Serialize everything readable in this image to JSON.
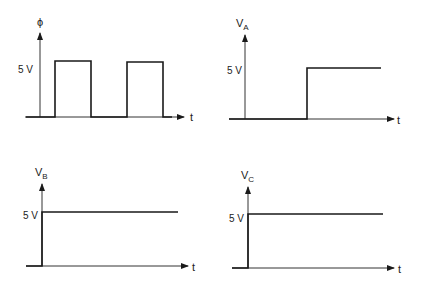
{
  "figure": {
    "panels": [
      {
        "id": "phi",
        "y_label": "ϕ",
        "y_subscript": "",
        "level_label": "5 V",
        "x_label": "t",
        "signal": "square-wave",
        "pulses": 2
      },
      {
        "id": "VA",
        "y_label": "V",
        "y_subscript": "A",
        "level_label": "5 V",
        "x_label": "t",
        "signal": "delayed-step"
      },
      {
        "id": "VB",
        "y_label": "V",
        "y_subscript": "B",
        "level_label": "5 V",
        "x_label": "t",
        "signal": "immediate-step"
      },
      {
        "id": "VC",
        "y_label": "V",
        "y_subscript": "C",
        "level_label": "5 V",
        "x_label": "t",
        "signal": "immediate-step"
      }
    ]
  },
  "colors": {
    "line": "#1a1a1a",
    "background": "#ffffff"
  }
}
